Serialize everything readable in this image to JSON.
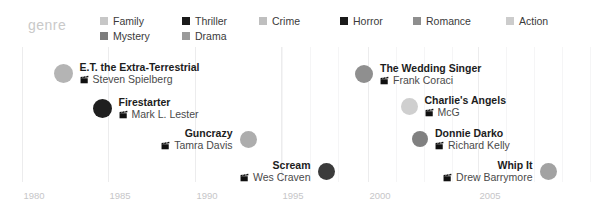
{
  "legend": {
    "title": "genre",
    "items": [
      {
        "label": "Family",
        "color": "#c7c7c7",
        "col": 0,
        "row": 0
      },
      {
        "label": "Mystery",
        "color": "#7d7d7d",
        "col": 0,
        "row": 1
      },
      {
        "label": "Thriller",
        "color": "#1a1a1a",
        "col": 1,
        "row": 0
      },
      {
        "label": "Drama",
        "color": "#9a9a9a",
        "col": 1,
        "row": 1
      },
      {
        "label": "Crime",
        "color": "#bfbfbf",
        "col": 2,
        "row": 0
      },
      {
        "label": "Horror",
        "color": "#1a1a1a",
        "col": 3,
        "row": 0
      },
      {
        "label": "Romance",
        "color": "#8e8e8e",
        "col": 4,
        "row": 0
      },
      {
        "label": "Action",
        "color": "#cccccc",
        "col": 5,
        "row": 0
      }
    ]
  },
  "chart_data": {
    "type": "scatter",
    "title": "",
    "xlabel": "",
    "ylabel": "",
    "xlim": [
      1980,
      2008
    ],
    "grid": true,
    "legend_position": "top",
    "axis_ticks": [
      {
        "label": "1980",
        "year": 1980
      },
      {
        "label": "1985",
        "year": 1985
      },
      {
        "label": "1990",
        "year": 1990
      },
      {
        "label": "1995",
        "year": 1995
      },
      {
        "label": "2000",
        "year": 2000
      },
      {
        "label": "2005",
        "year": 2005
      }
    ],
    "points": [
      {
        "title": "E.T. the Extra-Terrestrial",
        "director": "Steven Spielberg",
        "year": 1982,
        "genre": "Family",
        "color": "#b4b4b4",
        "size": 19,
        "align": "left",
        "x": 63,
        "y": 72
      },
      {
        "title": "Firestarter",
        "director": "Mark L. Lester",
        "year": 1984,
        "genre": "Horror",
        "color": "#1f1f1f",
        "size": 19,
        "align": "left",
        "x": 102,
        "y": 107
      },
      {
        "title": "Guncrazy",
        "director": "Tamra Davis",
        "year": 1992,
        "genre": "Drama",
        "color": "#adadad",
        "size": 17,
        "align": "right",
        "x": 248,
        "y": 138
      },
      {
        "title": "Scream",
        "director": "Wes Craven",
        "year": 1996,
        "genre": "Horror",
        "color": "#3b3b3b",
        "size": 17,
        "align": "right",
        "x": 326,
        "y": 170
      },
      {
        "title": "The Wedding Singer",
        "director": "Frank Coraci",
        "year": 1998,
        "genre": "Romance",
        "color": "#8f8f8f",
        "size": 18,
        "align": "left",
        "x": 364,
        "y": 73
      },
      {
        "title": "Charlie's Angels",
        "director": "McG",
        "year": 2000,
        "genre": "Action",
        "color": "#cfcfcf",
        "size": 17,
        "align": "left",
        "x": 409,
        "y": 105
      },
      {
        "title": "Donnie Darko",
        "director": "Richard Kelly",
        "year": 2001,
        "genre": "Mystery",
        "color": "#808080",
        "size": 16,
        "align": "left",
        "x": 420,
        "y": 138
      },
      {
        "title": "Whip It",
        "director": "Drew Barrymore",
        "year": 2009,
        "genre": "Drama",
        "color": "#a2a2a2",
        "size": 17,
        "align": "right",
        "x": 548,
        "y": 170
      }
    ]
  },
  "gridlines": {
    "major_x": [
      22,
      108,
      195,
      281,
      368,
      478
    ],
    "minor_x": [
      282,
      310,
      338,
      396,
      424,
      452,
      506,
      534,
      562,
      590
    ]
  },
  "icons": {
    "director": "clapperboard-icon"
  }
}
